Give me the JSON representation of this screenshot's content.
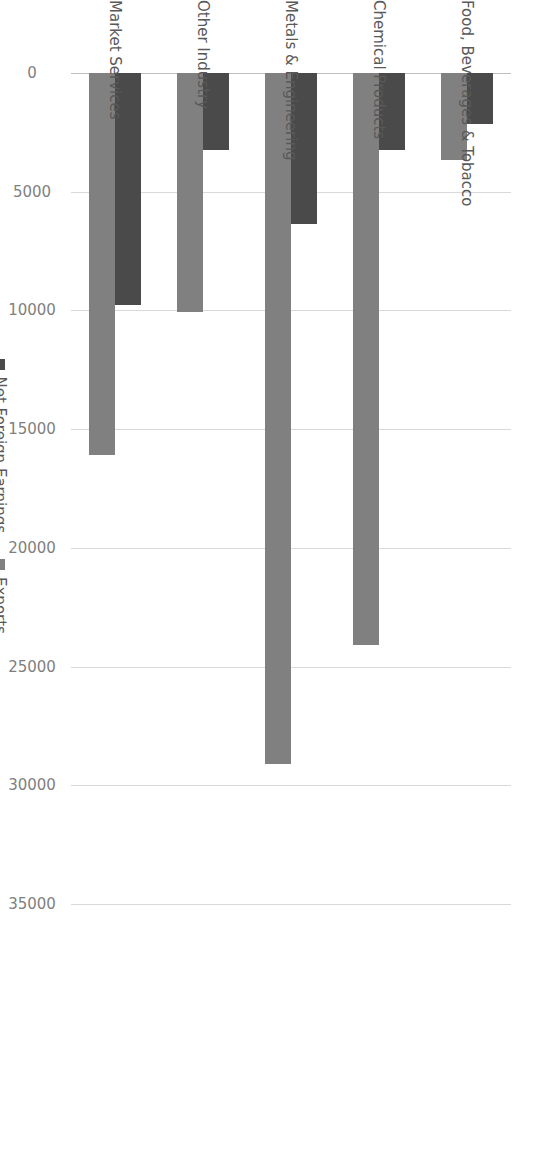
{
  "chart_data": {
    "type": "bar",
    "title": "",
    "subtitle": "",
    "xlabel": "",
    "ylabel": "",
    "orientation": "vertical",
    "grid": true,
    "legend_position": "right",
    "categories": [
      "Food, Beverages & Tobacco",
      "Chemical Products",
      "Metals & Engineering",
      "Other Industry",
      "Market Services"
    ],
    "series": [
      {
        "name": "Net Foreign Earnings",
        "color": "#4a4a4a",
        "values": [
          2150,
          3240,
          6360,
          3240,
          9770
        ]
      },
      {
        "name": "Exports",
        "color": "#808080",
        "values": [
          3660,
          24100,
          29100,
          10070,
          16090
        ]
      }
    ],
    "value_axis": {
      "min": 0,
      "max": 35000,
      "tick_step": 5000,
      "ticks": [
        0,
        5000,
        10000,
        15000,
        20000,
        25000,
        30000,
        35000
      ],
      "tick_labels": [
        "0",
        "5000",
        "10000",
        "15000",
        "20000",
        "25000",
        "30000",
        "35000"
      ]
    }
  },
  "legend": {
    "items": [
      {
        "label": "Net Foreign Earnings",
        "swatch": "nfe"
      },
      {
        "label": "Exports",
        "swatch": "exp"
      }
    ]
  },
  "colors": {
    "net_foreign_earnings": "#4a4a4a",
    "exports": "#808080",
    "gridline": "#d9d9d9",
    "axis": "#bfbfbf",
    "text": "#595959",
    "tick_text": "#7f7f7f",
    "background": "#ffffff"
  }
}
